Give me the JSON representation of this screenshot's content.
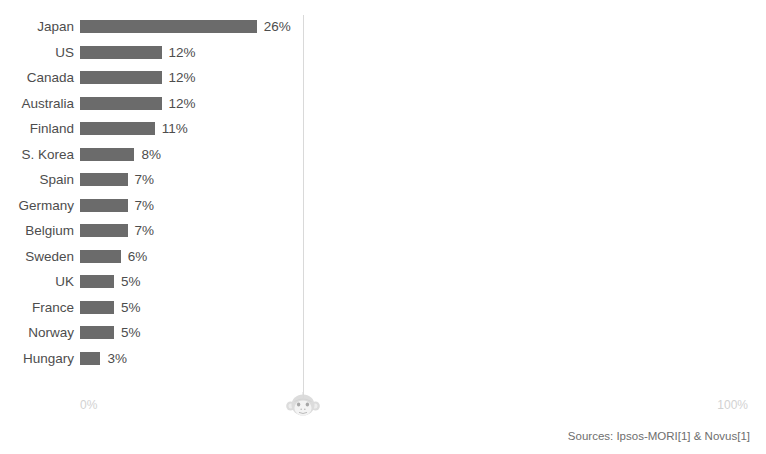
{
  "chart_data": {
    "type": "bar",
    "orientation": "horizontal",
    "title": "",
    "xlabel": "",
    "ylabel": "",
    "xlim": [
      0,
      100
    ],
    "grid": true,
    "gridline_value": 33,
    "legend": "none",
    "bar_color": "#6b6b6b",
    "categories": [
      "Japan",
      "US",
      "Canada",
      "Australia",
      "Finland",
      "S. Korea",
      "Spain",
      "Germany",
      "Belgium",
      "Sweden",
      "UK",
      "France",
      "Norway",
      "Hungary"
    ],
    "values": [
      26,
      12,
      12,
      12,
      11,
      8,
      7,
      7,
      7,
      6,
      5,
      5,
      5,
      3
    ],
    "value_labels": [
      "26%",
      "12%",
      "12%",
      "12%",
      "11%",
      "8%",
      "7%",
      "7%",
      "7%",
      "6%",
      "5%",
      "5%",
      "5%",
      "3%"
    ],
    "axis_ticks": [
      "0%",
      "100%"
    ]
  },
  "axis": {
    "left_tick": "0%",
    "right_tick": "100%"
  },
  "footer": {
    "sources": "Sources: Ipsos-MORI[1] & Novus[1]"
  },
  "watermark": {
    "icon": "monkey-face-icon",
    "color": "#e3e3e3"
  },
  "title_strip": {
    "text": ""
  }
}
